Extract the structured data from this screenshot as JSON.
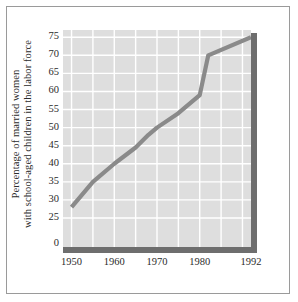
{
  "chart_data": {
    "type": "line",
    "title": "",
    "xlabel": "",
    "ylabel_line1": "Percentage of married women",
    "ylabel_line2": "with school-aged children in the labor force",
    "x": [
      1950,
      1955,
      1960,
      1965,
      1968,
      1970,
      1975,
      1980,
      1982,
      1992
    ],
    "values": [
      28,
      35,
      40,
      44.5,
      48,
      50,
      54,
      59,
      70,
      75
    ],
    "series": [
      {
        "name": "Percentage of married women with school-aged children in the labor force",
        "x": [
          1950,
          1955,
          1960,
          1965,
          1968,
          1970,
          1975,
          1980,
          1982,
          1992
        ],
        "values": [
          28,
          35,
          40,
          44.5,
          48,
          50,
          54,
          59,
          70,
          75
        ]
      }
    ],
    "xlim": [
      1948,
      1992
    ],
    "ylim": [
      0,
      77
    ],
    "y_axis_break": true,
    "y_axis_break_note": "axis jumps from 0 to 25",
    "yticks": [
      0,
      25,
      30,
      35,
      40,
      45,
      50,
      55,
      60,
      65,
      70,
      75
    ],
    "ytick_labels": [
      "0",
      "25",
      "30",
      "35",
      "40",
      "45",
      "50",
      "55",
      "60",
      "65",
      "70",
      "75"
    ],
    "xticks": [
      1950,
      1960,
      1970,
      1980,
      1992
    ],
    "xtick_labels": [
      "1950",
      "1960",
      "1970",
      "1980",
      "1992"
    ],
    "grid": true,
    "grid_color": "#ffffff",
    "plot_background": "#dedede",
    "line_color": "#8a8a8a",
    "axis_color": "#6e6e6e",
    "legend": "none",
    "legend_position": "none"
  }
}
